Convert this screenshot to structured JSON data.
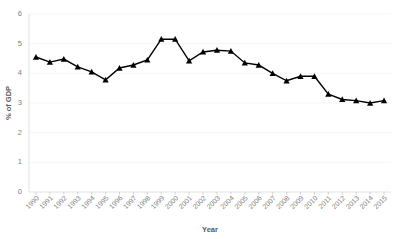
{
  "chart_data": {
    "type": "line",
    "title": "",
    "xlabel": "Year",
    "ylabel": "% of GDP",
    "categories": [
      "1990",
      "1991",
      "1992",
      "1993",
      "1994",
      "1995",
      "1996",
      "1997",
      "1998",
      "1999",
      "2000",
      "2001",
      "2002",
      "2003",
      "2004",
      "2005",
      "2006",
      "2007",
      "2008",
      "2009",
      "2010",
      "2011",
      "2012",
      "2013",
      "2014",
      "2015"
    ],
    "values": [
      4.55,
      4.38,
      4.48,
      4.22,
      4.05,
      3.78,
      4.18,
      4.28,
      4.45,
      5.15,
      5.15,
      4.42,
      4.72,
      4.78,
      4.75,
      4.35,
      4.28,
      4.0,
      3.75,
      3.9,
      3.9,
      3.3,
      3.12,
      3.08,
      3.0,
      3.08
    ],
    "series": [
      {
        "name": "% of GDP",
        "values": [
          4.55,
          4.38,
          4.48,
          4.22,
          4.05,
          3.78,
          4.18,
          4.28,
          4.45,
          5.15,
          5.15,
          4.42,
          4.72,
          4.78,
          4.75,
          4.35,
          4.28,
          4.0,
          3.75,
          3.9,
          3.9,
          3.3,
          3.12,
          3.08,
          3.0,
          3.08
        ],
        "color": "#000000",
        "marker": "triangle"
      }
    ],
    "ylim": [
      0,
      6
    ],
    "yticks": [
      0,
      1,
      2,
      3,
      4,
      5,
      6
    ],
    "ytick_labels": [
      "0",
      "1",
      "2",
      "3",
      "4",
      "5",
      "6"
    ],
    "grid": true,
    "grid_axis": "y",
    "legend": false,
    "legend_position": "none",
    "xtick_rotation": -45,
    "colors": {
      "line": "#000000",
      "marker": "#000000",
      "gridline": "#f2f2f2",
      "axis": "#d9d9d9",
      "tick_text": "#808080",
      "title_text": "#5a5a5a",
      "background": "#ffffff"
    }
  }
}
